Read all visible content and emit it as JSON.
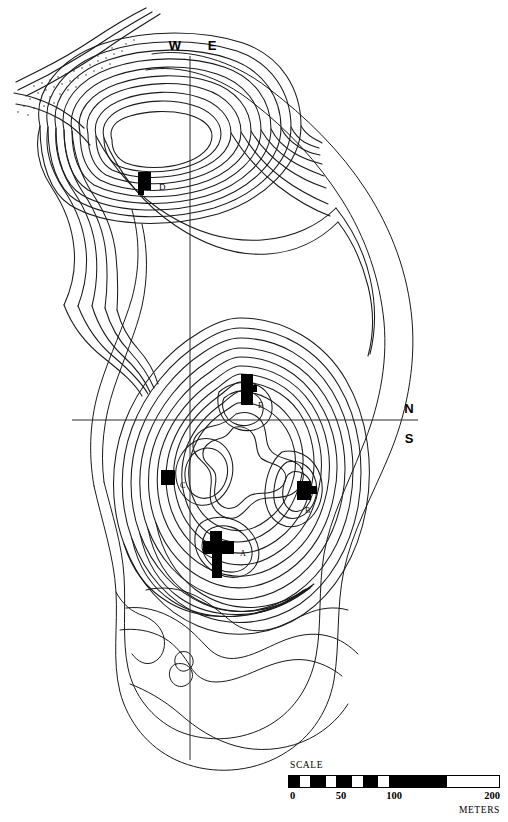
{
  "figure": {
    "kind": "topographic-contour-map"
  },
  "compass": {
    "west_label": "W",
    "east_label": "E",
    "north_label": "N",
    "south_label": "S"
  },
  "structures": [
    {
      "id": "A",
      "label": "A",
      "shape": "cross",
      "x": 216,
      "y": 549
    },
    {
      "id": "B",
      "label": "B",
      "shape": "blocky",
      "x": 304,
      "y": 490
    },
    {
      "id": "C",
      "label": "C",
      "shape": "square",
      "x": 167,
      "y": 478
    },
    {
      "id": "D",
      "label": "D",
      "shape": "rect-step",
      "x": 144,
      "y": 181
    },
    {
      "id": "E",
      "label": "E",
      "shape": "tall-block",
      "x": 248,
      "y": 387
    }
  ],
  "scale": {
    "title": "SCALE",
    "units": "METERS",
    "ticks": [
      {
        "value": "0",
        "pos": 0
      },
      {
        "value": "50",
        "pos": 25
      },
      {
        "value": "100",
        "pos": 50
      },
      {
        "value": "200",
        "pos": 100
      }
    ],
    "min": 0,
    "max": 200,
    "segments": [
      {
        "from": 0,
        "to": 5
      },
      {
        "from": 10,
        "to": 17.5
      },
      {
        "from": 22.5,
        "to": 30
      },
      {
        "from": 35,
        "to": 42.5
      },
      {
        "from": 47.5,
        "to": 75
      }
    ]
  },
  "chart_data": {
    "type": "map",
    "contour_count_main_hill": 13,
    "contour_count_north_hill": 10,
    "structures": [
      "A",
      "B",
      "C",
      "D",
      "E"
    ],
    "scale_range_meters": [
      0,
      200
    ],
    "axes": [
      "W-E vertical baseline",
      "N-S horizontal baseline"
    ]
  }
}
